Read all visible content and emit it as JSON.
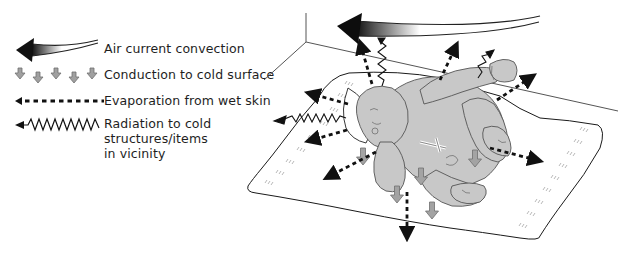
{
  "figure": {
    "colors": {
      "ink": "#1a1a1a",
      "skin_fill": "#c8c8c8",
      "skin_stroke": "#555555",
      "conduction_arrow_fill": "#a0a0a0",
      "conduction_arrow_stroke": "#6e6e6e",
      "blanket_fill": "#ffffff",
      "blanket_stitch": "#9a9a9a",
      "background": "#ffffff"
    }
  },
  "legend": {
    "items": [
      {
        "id": "convection",
        "icon": "curved-gradient-arrow-icon",
        "lines": [
          "Air current convection"
        ]
      },
      {
        "id": "conduction",
        "icon": "small-gray-down-arrows-icon",
        "lines": [
          "Conduction to cold surface"
        ]
      },
      {
        "id": "evaporation",
        "icon": "dotted-arrow-icon",
        "lines": [
          "Evaporation from wet skin"
        ]
      },
      {
        "id": "radiation",
        "icon": "wavy-arrow-icon",
        "lines": [
          "Radiation to cold",
          "structures/items",
          "in vicinity"
        ]
      }
    ]
  }
}
